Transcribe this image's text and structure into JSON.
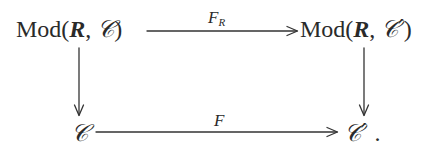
{
  "diagram": {
    "type": "commutative-square",
    "nodes": {
      "top_left": {
        "prefix": "Mod(",
        "arg1": "R",
        "sep": ", ",
        "arg2": "𝒞",
        "suffix": ")"
      },
      "top_right": {
        "prefix": "Mod(",
        "arg1": "R",
        "sep": ", ",
        "arg2": "𝒞′",
        "suffix": ")"
      },
      "bottom_left": {
        "symbol": "𝒞"
      },
      "bottom_right": {
        "symbol": "𝒞′",
        "trailing": "."
      }
    },
    "arrows": {
      "top": {
        "from": "top_left",
        "to": "top_right",
        "label_main": "F",
        "label_sub": "R"
      },
      "bottom": {
        "from": "bottom_left",
        "to": "bottom_right",
        "label_main": "F"
      },
      "left": {
        "from": "top_left",
        "to": "bottom_left",
        "label_main": ""
      },
      "right": {
        "from": "top_right",
        "to": "bottom_right",
        "label_main": ""
      }
    }
  }
}
